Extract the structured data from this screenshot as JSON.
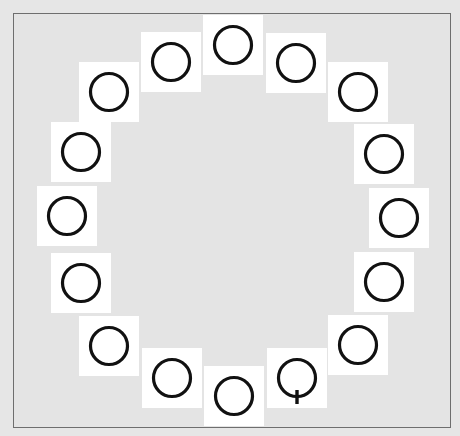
{
  "task": {
    "type": "visual-search",
    "distractor_glyph": "O",
    "target_glyph": "Q"
  },
  "colors": {
    "background": "#e4e4e4",
    "card": "#ffffff",
    "stroke": "#111111",
    "frame_border": "#6e6e6e"
  },
  "cards": [
    {
      "glyph": "O",
      "cx": 233,
      "cy": 45
    },
    {
      "glyph": "O",
      "cx": 296,
      "cy": 63
    },
    {
      "glyph": "O",
      "cx": 358,
      "cy": 92
    },
    {
      "glyph": "O",
      "cx": 384,
      "cy": 154
    },
    {
      "glyph": "O",
      "cx": 399,
      "cy": 218
    },
    {
      "glyph": "O",
      "cx": 384,
      "cy": 282
    },
    {
      "glyph": "O",
      "cx": 358,
      "cy": 345
    },
    {
      "glyph": "Q",
      "cx": 297,
      "cy": 378
    },
    {
      "glyph": "O",
      "cx": 234,
      "cy": 396
    },
    {
      "glyph": "O",
      "cx": 172,
      "cy": 378
    },
    {
      "glyph": "O",
      "cx": 109,
      "cy": 346
    },
    {
      "glyph": "O",
      "cx": 81,
      "cy": 283
    },
    {
      "glyph": "O",
      "cx": 67,
      "cy": 216
    },
    {
      "glyph": "O",
      "cx": 81,
      "cy": 152
    },
    {
      "glyph": "O",
      "cx": 109,
      "cy": 92
    },
    {
      "glyph": "O",
      "cx": 171,
      "cy": 62
    }
  ]
}
